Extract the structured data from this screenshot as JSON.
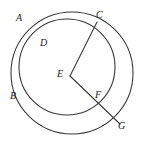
{
  "figure": {
    "background_color": "#ffffff",
    "stroke_color": "#3a3a3a",
    "label_color": "#1a1a1a",
    "width": 144,
    "height": 152,
    "circles": [
      {
        "name": "circle-a",
        "label_for": "A",
        "cx": 72,
        "cy": 73,
        "r": 61,
        "stroke": "#3a3a3a",
        "stroke_width": 1.1
      },
      {
        "name": "circle-d",
        "label_for": "D",
        "cx": 67,
        "cy": 67,
        "r": 48,
        "stroke": "#3a3a3a",
        "stroke_width": 1.1
      }
    ],
    "segments": [
      {
        "name": "segment-ec",
        "from": "E",
        "to": "C",
        "x1": 70,
        "y1": 76,
        "x2": 97,
        "y2": 22,
        "stroke": "#3a3a3a",
        "stroke_width": 1.1
      },
      {
        "name": "segment-eg",
        "from": "E",
        "to": "G",
        "x1": 70,
        "y1": 76,
        "x2": 120,
        "y2": 124,
        "stroke": "#3a3a3a",
        "stroke_width": 1.1
      }
    ],
    "points": [
      {
        "id": "A",
        "label": "A",
        "x": 16,
        "y": 13,
        "px": 97,
        "py": 22,
        "note": "label on circle A arc, upper left"
      },
      {
        "id": "B",
        "label": "B",
        "x": 10,
        "y": 91,
        "px": 21,
        "py": 96,
        "note": "lower intersection of the two circles"
      },
      {
        "id": "C",
        "label": "C",
        "x": 96,
        "y": 10,
        "px": 97,
        "py": 22,
        "note": "upper intersection of the two circles"
      },
      {
        "id": "D",
        "label": "D",
        "x": 40,
        "y": 38,
        "px": 67,
        "py": 67,
        "note": "label on circle D arc, upper left interior"
      },
      {
        "id": "E",
        "label": "E",
        "x": 57,
        "y": 69,
        "px": 70,
        "py": 76,
        "note": "center of circle A"
      },
      {
        "id": "F",
        "label": "F",
        "x": 95,
        "y": 90,
        "px": 92,
        "py": 97,
        "note": "where EG crosses circle D"
      },
      {
        "id": "G",
        "label": "G",
        "x": 118,
        "y": 121,
        "px": 120,
        "py": 124,
        "note": "endpoint of radius EG on circle A"
      }
    ]
  }
}
